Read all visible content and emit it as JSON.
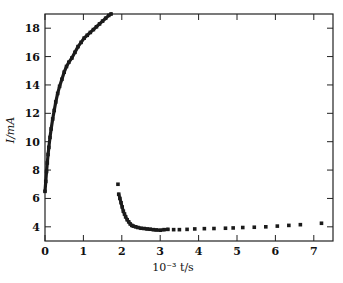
{
  "chart_data": {
    "type": "scatter",
    "title": "",
    "xlabel": "10⁻³ t/s",
    "ylabel": "I/mA",
    "xlim": [
      0,
      7.5
    ],
    "ylim": [
      3,
      19
    ],
    "xticks": [
      0,
      1,
      2,
      3,
      4,
      5,
      6,
      7
    ],
    "yticks": [
      4,
      6,
      8,
      10,
      12,
      14,
      16,
      18
    ],
    "xtick_labels": [
      "0",
      "1",
      "2",
      "3",
      "4",
      "5",
      "6",
      "7"
    ],
    "ytick_labels": [
      "4",
      "6",
      "8",
      "10",
      "12",
      "14",
      "16",
      "18"
    ],
    "grid": false,
    "legend": "none",
    "series": [
      {
        "name": "charging",
        "x": [
          0.0,
          0.02,
          0.04,
          0.06,
          0.08,
          0.1,
          0.13,
          0.16,
          0.2,
          0.24,
          0.28,
          0.33,
          0.38,
          0.44,
          0.5,
          0.56,
          0.62,
          0.7,
          0.78,
          0.86,
          0.94,
          1.02,
          1.1,
          1.18,
          1.26,
          1.34,
          1.42,
          1.5,
          1.58,
          1.66,
          1.72
        ],
        "y": [
          6.5,
          7.2,
          7.9,
          8.5,
          9.1,
          9.6,
          10.3,
          10.9,
          11.6,
          12.2,
          12.8,
          13.4,
          13.9,
          14.4,
          14.9,
          15.3,
          15.6,
          15.9,
          16.3,
          16.7,
          17.0,
          17.3,
          17.5,
          17.7,
          17.9,
          18.1,
          18.3,
          18.5,
          18.7,
          18.9,
          19.0
        ]
      },
      {
        "name": "discharging",
        "x": [
          1.9,
          1.92,
          1.95,
          1.98,
          2.01,
          2.04,
          2.07,
          2.1,
          2.14,
          2.18,
          2.22,
          2.26,
          2.3,
          2.36,
          2.42,
          2.5,
          2.58,
          2.66,
          2.74,
          2.82,
          2.9,
          3.0,
          3.1,
          3.2,
          3.35,
          3.5,
          3.7,
          3.9,
          4.15,
          4.4,
          4.7,
          4.9,
          5.15,
          5.45,
          5.75,
          6.05,
          6.35,
          6.65,
          7.2
        ],
        "y": [
          7.0,
          6.3,
          6.0,
          5.7,
          5.4,
          5.1,
          4.9,
          4.7,
          4.5,
          4.35,
          4.2,
          4.1,
          4.05,
          4.0,
          3.95,
          3.9,
          3.88,
          3.85,
          3.83,
          3.8,
          3.78,
          3.76,
          3.8,
          3.82,
          3.8,
          3.8,
          3.82,
          3.85,
          3.87,
          3.88,
          3.9,
          3.92,
          3.95,
          3.97,
          4.0,
          4.05,
          4.1,
          4.15,
          4.25
        ]
      }
    ]
  }
}
